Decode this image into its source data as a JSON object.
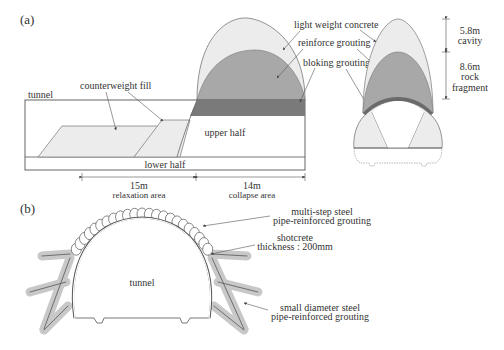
{
  "panel_a": {
    "label": "(a)",
    "tunnel_label": "tunnel",
    "counterweight_label": "counterweight fill",
    "upper_half_label": "upper half",
    "lower_half_label": "lower half",
    "light_weight_label": "light weight concrete",
    "reinforce_label": "reinforce grouting",
    "bloking_label": "bloking grouting",
    "relaxation_len": "15m",
    "relaxation_label": "relaxation area",
    "collapse_len": "14m",
    "collapse_label": "collapse area",
    "cavity_len": "5.8m",
    "cavity_label": "cavity",
    "rock_len": "8.6m",
    "rock_label1": "rock",
    "rock_label2": "fragment"
  },
  "panel_b": {
    "label": "(b)",
    "tunnel_label": "tunnel",
    "multistep_line1": "multi-step steel",
    "multistep_line2": "pipe-reinforced grouting",
    "shotcrete_line1": "shotcrete",
    "shotcrete_line2": "thickness : 200mm",
    "small_line1": "small diameter steel",
    "small_line2": "pipe-reinforced grouting"
  },
  "colors": {
    "light_fill": "#ececec",
    "mid_fill": "#a8a8a8",
    "dark_fill": "#7a7a7a",
    "line": "#555555"
  }
}
